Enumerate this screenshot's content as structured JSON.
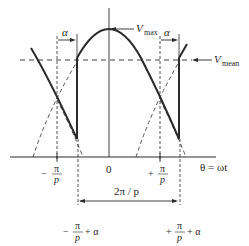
{
  "diagram": {
    "colors": {
      "ink": "#2a2a2a",
      "background": "#ffffff"
    },
    "labels": {
      "v_max": {
        "symbol": "V",
        "subscript": "max"
      },
      "v_mean": {
        "symbol": "V",
        "subscript": "mean"
      },
      "alpha_left": "α",
      "alpha_right": "α",
      "origin": "0",
      "axis": "θ = ωt",
      "neg_pi_p": {
        "sign": "−",
        "num": "π",
        "den": "p"
      },
      "pos_pi_p": {
        "sign": "+",
        "num": "π",
        "den": "p"
      },
      "neg_pi_p_alpha": {
        "sign": "−",
        "num": "π",
        "den": "p",
        "suffix": "+ α"
      },
      "pos_pi_p_alpha": {
        "sign": "+",
        "num": "π",
        "den": "p",
        "suffix": "+ α"
      },
      "period": "2π / p"
    }
  }
}
